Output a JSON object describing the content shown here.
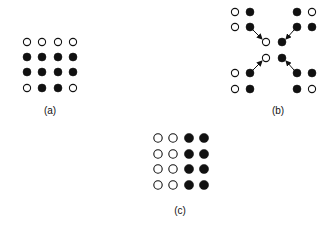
{
  "colors": {
    "filled": "#111111",
    "open_fill": "#ffffff",
    "stroke": "#111111",
    "background": "#ffffff"
  },
  "panels": [
    {
      "id": "a",
      "label": "(a)",
      "label_pos": [
        50,
        110
      ],
      "dots": [
        {
          "x": 27,
          "y": 42,
          "filled": false
        },
        {
          "x": 42,
          "y": 42,
          "filled": false
        },
        {
          "x": 58,
          "y": 42,
          "filled": false
        },
        {
          "x": 73,
          "y": 42,
          "filled": false
        },
        {
          "x": 27,
          "y": 57,
          "filled": true
        },
        {
          "x": 42,
          "y": 57,
          "filled": true
        },
        {
          "x": 58,
          "y": 57,
          "filled": true
        },
        {
          "x": 73,
          "y": 57,
          "filled": true
        },
        {
          "x": 27,
          "y": 72,
          "filled": true
        },
        {
          "x": 42,
          "y": 72,
          "filled": true
        },
        {
          "x": 58,
          "y": 72,
          "filled": true
        },
        {
          "x": 73,
          "y": 72,
          "filled": true
        },
        {
          "x": 27,
          "y": 88,
          "filled": false
        },
        {
          "x": 42,
          "y": 88,
          "filled": true
        },
        {
          "x": 58,
          "y": 88,
          "filled": true
        },
        {
          "x": 73,
          "y": 88,
          "filled": false
        }
      ],
      "arrows": []
    },
    {
      "id": "b",
      "label": "(b)",
      "label_pos": [
        278,
        110
      ],
      "dots": [
        {
          "x": 235,
          "y": 12,
          "filled": false
        },
        {
          "x": 250,
          "y": 12,
          "filled": true
        },
        {
          "x": 297,
          "y": 12,
          "filled": true
        },
        {
          "x": 312,
          "y": 12,
          "filled": false
        },
        {
          "x": 235,
          "y": 27,
          "filled": false
        },
        {
          "x": 250,
          "y": 27,
          "filled": true
        },
        {
          "x": 297,
          "y": 27,
          "filled": true
        },
        {
          "x": 312,
          "y": 27,
          "filled": true
        },
        {
          "x": 266,
          "y": 42,
          "filled": false
        },
        {
          "x": 282,
          "y": 42,
          "filled": true
        },
        {
          "x": 266,
          "y": 58,
          "filled": false
        },
        {
          "x": 282,
          "y": 58,
          "filled": true
        },
        {
          "x": 235,
          "y": 73,
          "filled": false
        },
        {
          "x": 250,
          "y": 73,
          "filled": true
        },
        {
          "x": 297,
          "y": 73,
          "filled": true
        },
        {
          "x": 312,
          "y": 73,
          "filled": true
        },
        {
          "x": 235,
          "y": 89,
          "filled": false
        },
        {
          "x": 250,
          "y": 89,
          "filled": true
        },
        {
          "x": 297,
          "y": 89,
          "filled": true
        },
        {
          "x": 312,
          "y": 89,
          "filled": false
        }
      ],
      "arrows": [
        {
          "x1": 253,
          "y1": 30,
          "x2": 262,
          "y2": 39
        },
        {
          "x1": 294,
          "y1": 30,
          "x2": 286,
          "y2": 39
        },
        {
          "x1": 253,
          "y1": 70,
          "x2": 262,
          "y2": 61
        },
        {
          "x1": 294,
          "y1": 70,
          "x2": 286,
          "y2": 61
        }
      ]
    },
    {
      "id": "c",
      "label": "(c)",
      "label_pos": [
        180,
        210
      ],
      "dots": [
        {
          "x": 158,
          "y": 138,
          "filled": false
        },
        {
          "x": 173,
          "y": 138,
          "filled": false
        },
        {
          "x": 189,
          "y": 138,
          "filled": true
        },
        {
          "x": 204,
          "y": 138,
          "filled": true
        },
        {
          "x": 158,
          "y": 154,
          "filled": false
        },
        {
          "x": 173,
          "y": 154,
          "filled": false
        },
        {
          "x": 189,
          "y": 154,
          "filled": true
        },
        {
          "x": 204,
          "y": 154,
          "filled": true
        },
        {
          "x": 158,
          "y": 169,
          "filled": false
        },
        {
          "x": 173,
          "y": 169,
          "filled": false
        },
        {
          "x": 189,
          "y": 169,
          "filled": true
        },
        {
          "x": 204,
          "y": 169,
          "filled": true
        },
        {
          "x": 158,
          "y": 185,
          "filled": false
        },
        {
          "x": 173,
          "y": 185,
          "filled": false
        },
        {
          "x": 189,
          "y": 185,
          "filled": true
        },
        {
          "x": 204,
          "y": 185,
          "filled": true
        }
      ],
      "arrows": []
    }
  ],
  "dot_radius": 3.6,
  "dot_radius_c": 4.2
}
